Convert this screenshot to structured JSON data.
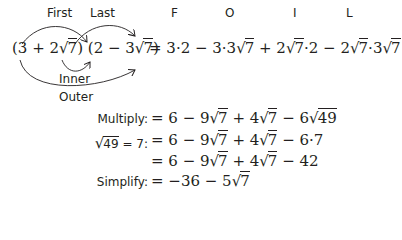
{
  "labels": {
    "first": "First",
    "last": "Last",
    "inner": "Inner",
    "outer": "Outer",
    "foil": [
      "F",
      "O",
      "I",
      "L"
    ]
  },
  "main": {
    "lhs_a": "(3 + 2",
    "lhs_a_rad": "7",
    "lhs_b": ") (2 − 3",
    "lhs_b_rad": "7",
    "lhs_c": ")",
    "rhs_1": "= 3·2 − 3·3",
    "rhs_1_rad": "7",
    "rhs_2": " + 2",
    "rhs_2_rad": "7",
    "rhs_3": "·2 − 2",
    "rhs_3_rad": "7",
    "rhs_4": "·3",
    "rhs_4_rad": "7"
  },
  "steps": [
    {
      "label": "Multiply:",
      "expr": [
        "= 6 − 9",
        "7",
        " + 4",
        "7",
        " − 6",
        "49"
      ]
    },
    {
      "label_rad": "49",
      "label_tail": " = 7:",
      "expr": [
        "= 6 − 9",
        "7",
        " + 4",
        "7",
        " − 6·7"
      ]
    },
    {
      "label": "",
      "expr": [
        "= 6 − 9",
        "7",
        " + 4",
        "7",
        " − 42"
      ]
    },
    {
      "label": "Simplify:",
      "expr": [
        "= −36 − 5",
        "7"
      ]
    }
  ],
  "colors": {
    "text": "#231f20",
    "background": "#ffffff"
  }
}
